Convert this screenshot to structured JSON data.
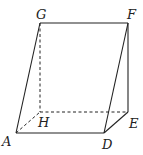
{
  "diagram": {
    "type": "triangular prism (oblique view)",
    "colors": {
      "line": "#222222",
      "background": "#ffffff"
    },
    "points": {
      "G": [
        40,
        23
      ],
      "F": [
        128,
        23
      ],
      "H": [
        40,
        112
      ],
      "E": [
        128,
        112
      ],
      "A": [
        16,
        133
      ],
      "D": [
        104,
        133
      ]
    },
    "labels": {
      "G": "G",
      "F": "F",
      "H": "H",
      "E": "E",
      "A": "A",
      "D": "D"
    },
    "solid_edges": [
      "GF",
      "GA",
      "AD",
      "DF",
      "FE",
      "DE"
    ],
    "dashed_edges": [
      "GH",
      "HE",
      "AH"
    ]
  }
}
